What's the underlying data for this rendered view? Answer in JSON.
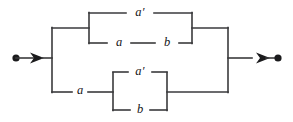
{
  "diagram": {
    "type": "series-parallel-network",
    "canvas": {
      "width": 293,
      "height": 122
    },
    "style": {
      "line_color": "#3a3a3c",
      "node_color": "#1b1b1d",
      "label_color": "#141416",
      "background": "#ffffff",
      "line_width": 1.6
    },
    "terminals": {
      "source": {
        "label": "",
        "cx": 16,
        "cy": 58,
        "r": 3.6
      },
      "sink": {
        "label": "",
        "cx": 278,
        "cy": 58,
        "r": 3.6
      }
    },
    "arrows": {
      "input": {
        "tip_x": 44,
        "y": 58
      },
      "output": {
        "tip_x": 270,
        "y": 58
      }
    },
    "branches": [
      {
        "name": "upper-branch",
        "inner_parallel": [
          {
            "name": "upper-top-edge",
            "label": "a′",
            "label_x": 140,
            "label_y": 13
          },
          {
            "name": "upper-bottom-series-first",
            "label": "a",
            "label_x": 119,
            "label_y": 43
          },
          {
            "name": "upper-bottom-series-second",
            "label": "b",
            "label_x": 167,
            "label_y": 43
          }
        ]
      },
      {
        "name": "lower-branch",
        "series_prefix": {
          "name": "lower-series-edge",
          "label": "a",
          "label_x": 80,
          "label_y": 91
        },
        "inner_parallel": [
          {
            "name": "lower-top-edge",
            "label": "a′",
            "label_x": 140,
            "label_y": 72
          },
          {
            "name": "lower-bottom-edge",
            "label": "b",
            "label_x": 140,
            "label_y": 110
          }
        ]
      }
    ],
    "labels": {
      "a_prime_upper": "a′",
      "a_upper": "a",
      "b_upper": "b",
      "a_lower": "a",
      "a_prime_lower": "a′",
      "b_lower": "b"
    }
  }
}
